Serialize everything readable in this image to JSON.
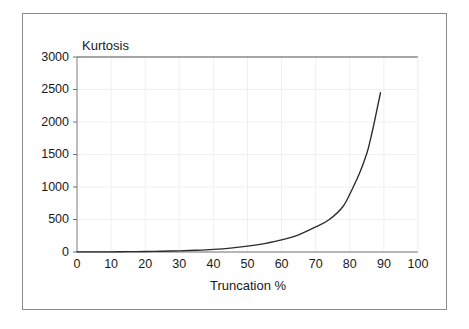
{
  "chart_data": {
    "type": "line",
    "title": "",
    "xlabel": "Truncation %",
    "ylabel": "Kurtosis",
    "xlim": [
      0,
      100
    ],
    "ylim": [
      0,
      3000
    ],
    "xticks": [
      0,
      10,
      20,
      30,
      40,
      50,
      60,
      70,
      80,
      90,
      100
    ],
    "yticks": [
      0,
      500,
      1000,
      1500,
      2000,
      2500,
      3000
    ],
    "xtick_labels": [
      "0",
      "10",
      "20",
      "30",
      "40",
      "50",
      "60",
      "70",
      "80",
      "90",
      "100"
    ],
    "ytick_labels": [
      "0",
      "500",
      "1000",
      "1500",
      "2000",
      "2500",
      "3000"
    ],
    "grid": true,
    "legend": null,
    "series": [
      {
        "name": "Kurtosis",
        "color": "#2b2b2b",
        "x": [
          0,
          5,
          10,
          15,
          20,
          25,
          30,
          35,
          40,
          45,
          50,
          55,
          60,
          65,
          70,
          74,
          78,
          81,
          83,
          85,
          86,
          87,
          88,
          89
        ],
        "y": [
          1,
          2,
          3,
          5,
          8,
          12,
          18,
          27,
          40,
          60,
          90,
          130,
          185,
          265,
          385,
          500,
          700,
          1000,
          1230,
          1520,
          1720,
          1950,
          2200,
          2450
        ]
      }
    ]
  },
  "axes": {
    "y_axis_label": "Kurtosis",
    "x_axis_label": "Truncation %"
  },
  "colors": {
    "curve": "#2b2b2b",
    "frame_border": "#8c8c8c",
    "axis_line": "#4d4d4d",
    "top_rule": "#4d4d4d",
    "gridline": "#f0f0f0",
    "text": "#1a1a1a",
    "background": "#ffffff"
  }
}
